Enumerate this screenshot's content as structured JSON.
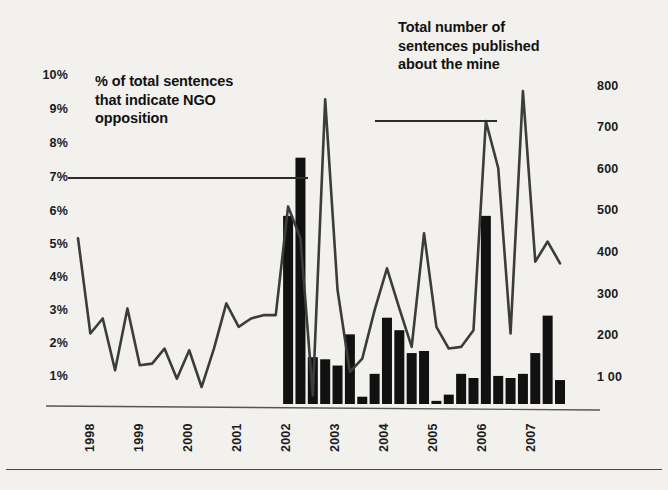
{
  "annotations": {
    "left_note": "% of total sentences that indicate NGO opposition",
    "right_note": "Total number of sentences published about the mine"
  },
  "chart_data": {
    "type": "bar",
    "title": "",
    "subtitle": "",
    "xlabel": "",
    "ylabel": "% of total sentences that indicate NGO opposition",
    "y2label": "Total number of sentences published about the mine",
    "grid": false,
    "legend_position": "inline-annotation",
    "x_tick_labels": [
      "1998",
      "1999",
      "2000",
      "2001",
      "2002",
      "2003",
      "2004",
      "2005",
      "2006",
      "2007"
    ],
    "y_tick_labels": [
      "1%",
      "2%",
      "3%",
      "4%",
      "5%",
      "6%",
      "7%",
      "8%",
      "9%",
      "10%"
    ],
    "y2_tick_labels": [
      "1 00",
      "200",
      "300",
      "400",
      "500",
      "600",
      "700",
      "800"
    ],
    "ylim": [
      0,
      10
    ],
    "y2lim": [
      0,
      845
    ],
    "x_period": "quarterly 1998 Q1 - 2007 Q4",
    "series": [
      {
        "name": "% of total sentences that indicate NGO opposition",
        "type": "line",
        "axis": "left",
        "color": "#3c3c3c",
        "x": [
          "1998Q1",
          "1998Q2",
          "1998Q3",
          "1998Q4",
          "1999Q1",
          "1999Q2",
          "1999Q3",
          "1999Q4",
          "2000Q1",
          "2000Q2",
          "2000Q3",
          "2000Q4",
          "2001Q1",
          "2001Q2",
          "2001Q3",
          "2001Q4",
          "2002Q1",
          "2002Q2",
          "2002Q3",
          "2002Q4",
          "2003Q1",
          "2003Q2",
          "2003Q3",
          "2003Q4",
          "2004Q1",
          "2004Q2",
          "2004Q3",
          "2004Q4",
          "2005Q1",
          "2005Q2",
          "2005Q3",
          "2005Q4",
          "2006Q1",
          "2006Q2",
          "2006Q3",
          "2006Q4",
          "2007Q1",
          "2007Q2",
          "2007Q3",
          "2007Q4"
        ],
        "values": [
          5.15,
          2.3,
          2.75,
          1.2,
          3.05,
          1.35,
          1.4,
          1.85,
          0.95,
          1.8,
          0.7,
          1.85,
          3.2,
          2.5,
          2.75,
          2.85,
          2.85,
          6.1,
          5.15,
          0.45,
          9.3,
          3.6,
          1.15,
          1.55,
          3.0,
          4.25,
          3.05,
          1.9,
          5.3,
          2.5,
          1.85,
          1.9,
          2.4,
          8.65,
          7.25,
          2.3,
          9.55,
          4.45,
          5.05,
          4.4
        ],
        "annotated_points": [
          {
            "label": "1998 start",
            "value": 5.15
          },
          {
            "label": "2003 peak",
            "value": 9.3
          },
          {
            "label": "2007 peak",
            "value": 9.55
          }
        ]
      },
      {
        "name": "Total number of sentences published about the mine",
        "type": "bar",
        "axis": "right",
        "color": "#111111",
        "x": [
          "2002Q2",
          "2002Q3",
          "2002Q4",
          "2003Q1",
          "2003Q2",
          "2003Q3",
          "2003Q4",
          "2004Q1",
          "2004Q2",
          "2004Q3",
          "2004Q4",
          "2005Q1",
          "2005Q2",
          "2005Q3",
          "2005Q4",
          "2006Q1",
          "2006Q2",
          "2006Q3",
          "2006Q4",
          "2007Q1",
          "2007Q2",
          "2007Q3",
          "2007Q4"
        ],
        "values": [
          490,
          630,
          150,
          145,
          130,
          205,
          55,
          110,
          245,
          215,
          160,
          165,
          45,
          60,
          110,
          100,
          490,
          105,
          100,
          110,
          160,
          250,
          95
        ]
      }
    ]
  },
  "axes": {
    "left_ticks": [
      {
        "label": "10%",
        "y": 76
      },
      {
        "label": "9%",
        "y": 110
      },
      {
        "label": "8%",
        "y": 144
      },
      {
        "label": "7%",
        "y": 178
      },
      {
        "label": "6%",
        "y": 212
      },
      {
        "label": "5%",
        "y": 245
      },
      {
        "label": "4%",
        "y": 278
      },
      {
        "label": "3%",
        "y": 311
      },
      {
        "label": "2%",
        "y": 344
      },
      {
        "label": "1%",
        "y": 377
      }
    ],
    "right_ticks": [
      {
        "label": "800",
        "y": 87
      },
      {
        "label": "700",
        "y": 128
      },
      {
        "label": "600",
        "y": 170
      },
      {
        "label": "500",
        "y": 211
      },
      {
        "label": "400",
        "y": 253
      },
      {
        "label": "300",
        "y": 295
      },
      {
        "label": "200",
        "y": 336
      },
      {
        "label": "1 00",
        "y": 378
      }
    ],
    "x_ticks": [
      {
        "label": "1998",
        "x": 88
      },
      {
        "label": "1999",
        "x": 137
      },
      {
        "label": "2000",
        "x": 186
      },
      {
        "label": "2001",
        "x": 235
      },
      {
        "label": "2002",
        "x": 284
      },
      {
        "label": "2003",
        "x": 333
      },
      {
        "label": "2004",
        "x": 382
      },
      {
        "label": "2005",
        "x": 431
      },
      {
        "label": "2006",
        "x": 480
      },
      {
        "label": "2007",
        "x": 529
      }
    ]
  },
  "colors": {
    "background": "#f2f1ee",
    "line": "#3c3c3c",
    "bar": "#111111",
    "axis": "#555555",
    "text": "#1a1a1a"
  }
}
